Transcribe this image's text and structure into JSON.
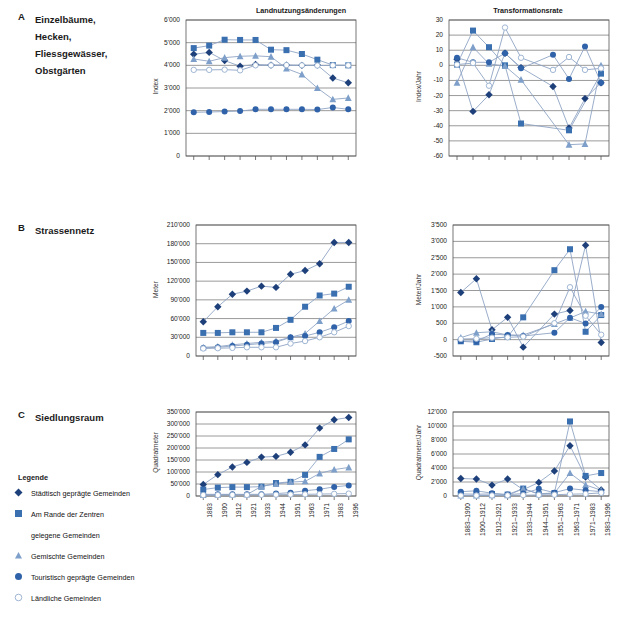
{
  "figure": {
    "panels": [
      {
        "letter": "A",
        "title_lines": [
          "Einzelbäume,",
          "Hecken,",
          "Fliessgewässer,",
          "Obstgärten"
        ]
      },
      {
        "letter": "B",
        "title_lines": [
          "Strassennetz"
        ]
      },
      {
        "letter": "C",
        "title_lines": [
          "Siedlungsraum"
        ]
      }
    ],
    "column_titles": [
      "Landnutzungsänderungen",
      "Transformationsrate"
    ]
  },
  "legend": {
    "title": "Legende",
    "items": [
      {
        "marker": "diamond",
        "color": "#1d3f7a",
        "label": "Städtisch geprägte Gemeinden"
      },
      {
        "marker": "square",
        "color": "#3a6fb0",
        "label": "Am Rande der Zentren"
      },
      {
        "marker": "none",
        "color": "#ffffff",
        "label": "gelegene Gemeinden"
      },
      {
        "marker": "triangle",
        "color": "#7d9fc9",
        "label": "Gemischte Gemeinden"
      },
      {
        "marker": "circle",
        "color": "#2f62a8",
        "label": "Touristisch geprägte Gemeinden"
      },
      {
        "marker": "opencircle",
        "color": "#ffffff",
        "label": "Ländliche Gemeinden"
      }
    ]
  },
  "series_names": [
    "Städtisch geprägte Gemeinden",
    "Am Rande der Zentren gelegene Gemeinden",
    "Gemischte Gemeinden",
    "Touristisch geprägte Gemeinden",
    "Ländliche Gemeinden"
  ],
  "colors": {
    "diamond": "#1d3f7a",
    "square": "#3a6fb0",
    "triangle": "#7d9fc9",
    "circle": "#2f62a8",
    "opencircle_stroke": "#9fb6d4",
    "line": "#8fa4c4",
    "grid": "#808080",
    "axis": "#555555"
  },
  "chart_data": [
    {
      "id": "A-left",
      "type": "line",
      "title": "Landnutzungsänderungen",
      "ylabel": "Index",
      "xlabel": "",
      "ylim": [
        0,
        6000
      ],
      "yticks": [
        0,
        1000,
        2000,
        3000,
        4000,
        5000,
        6000
      ],
      "ytick_labels": [
        "0",
        "1'000",
        "2'000",
        "3'000",
        "4'000",
        "5'000",
        "6'000"
      ],
      "categories": [
        "1883",
        "1900",
        "1912",
        "1921",
        "1933",
        "1944",
        "1951",
        "1963",
        "1971",
        "1983",
        "1996"
      ],
      "show_xticklabels": false,
      "grid": true,
      "series": [
        {
          "name": "Städtisch geprägte Gemeinden",
          "marker": "diamond",
          "values": [
            4490,
            4570,
            4210,
            3960,
            4040,
            4010,
            4010,
            4000,
            4010,
            3440,
            3230
          ]
        },
        {
          "name": "Am Rande der Zentren gelegene Gemeinden",
          "marker": "square",
          "values": [
            4760,
            4870,
            5130,
            5120,
            5120,
            4690,
            4670,
            4500,
            4250,
            4010,
            4000
          ]
        },
        {
          "name": "Gemischte Gemeinden",
          "marker": "triangle",
          "values": [
            4280,
            4180,
            4340,
            4400,
            4420,
            4380,
            3860,
            3600,
            3000,
            2500,
            2560
          ]
        },
        {
          "name": "Touristisch geprägte Gemeinden",
          "marker": "circle",
          "values": [
            1930,
            1940,
            1960,
            1980,
            2060,
            2060,
            2060,
            2060,
            2050,
            2140,
            2060
          ]
        },
        {
          "name": "Ländliche Gemeinden",
          "marker": "opencircle",
          "values": [
            3800,
            3800,
            3810,
            3780,
            4000,
            4000,
            4010,
            4000,
            3990,
            4000,
            4000
          ]
        }
      ]
    },
    {
      "id": "A-right",
      "type": "line",
      "title": "Transformationsrate",
      "ylabel": "Index/Jahr",
      "xlabel": "",
      "ylim": [
        -60,
        30
      ],
      "yticks": [
        -60,
        -50,
        -40,
        -30,
        -20,
        -10,
        0,
        10,
        20,
        30
      ],
      "ytick_labels": [
        "-60",
        "-50",
        "-40",
        "-30",
        "-20",
        "-10",
        "0",
        "10",
        "20",
        "30"
      ],
      "categories": [
        "1883–1900",
        "1900–1912",
        "1912–1921",
        "1921–1933",
        "1933–1944",
        "1944–1951",
        "1951–1963",
        "1963–1971",
        "1971–1983",
        "1983–1996"
      ],
      "show_xticklabels": false,
      "grid": true,
      "series": [
        {
          "name": "Städtisch geprägte Gemeinden",
          "marker": "diamond",
          "values": [
            4,
            -30.5,
            -19.5,
            8,
            -1.5,
            null,
            -14,
            -41.5,
            -22,
            -11.5
          ]
        },
        {
          "name": "Am Rande der Zentren gelegene Gemeinden",
          "marker": "square",
          "values": [
            0.5,
            23,
            12,
            0,
            -38.5,
            null,
            null,
            -43,
            null,
            -5.5
          ]
        },
        {
          "name": "Gemischte Gemeinden",
          "marker": "triangle",
          "values": [
            -11.5,
            12,
            1,
            -0.5,
            -9.5,
            null,
            null,
            -52.5,
            -52,
            0
          ]
        },
        {
          "name": "Touristisch geprägte Gemeinden",
          "marker": "circle",
          "values": [
            5,
            2,
            2,
            8,
            -2,
            null,
            7,
            -9,
            12.5,
            -11.5
          ]
        },
        {
          "name": "Ländliche Gemeinden",
          "marker": "opencircle",
          "values": [
            0.5,
            1.5,
            -13.5,
            25,
            5,
            null,
            -3,
            5.5,
            -3,
            -2
          ]
        }
      ]
    },
    {
      "id": "B-left",
      "type": "line",
      "title": "Landnutzungsänderungen",
      "ylabel": "Meter",
      "xlabel": "",
      "ylim": [
        0,
        210000
      ],
      "yticks": [
        0,
        30000,
        60000,
        90000,
        120000,
        150000,
        180000,
        210000
      ],
      "ytick_labels": [
        "0",
        "30'000",
        "60'000",
        "90'000",
        "120'000",
        "150'000",
        "180'000",
        "210'000"
      ],
      "categories": [
        "1883",
        "1900",
        "1912",
        "1921",
        "1933",
        "1944",
        "1951",
        "1963",
        "1971",
        "1983",
        "1996"
      ],
      "show_xticklabels": false,
      "grid": true,
      "series": [
        {
          "name": "Städtisch geprägte Gemeinden",
          "marker": "diamond",
          "values": [
            55000,
            79000,
            99000,
            104000,
            112000,
            110000,
            131000,
            137000,
            148000,
            182000,
            182000
          ]
        },
        {
          "name": "Am Rande der Zentren gelegene Gemeinden",
          "marker": "square",
          "values": [
            37000,
            37000,
            38000,
            38000,
            38000,
            45000,
            58000,
            79000,
            97000,
            100000,
            111000
          ]
        },
        {
          "name": "Gemischte Gemeinden",
          "marker": "triangle",
          "values": [
            14000,
            15000,
            18000,
            20000,
            22000,
            24000,
            30000,
            36000,
            56000,
            76000,
            90000
          ]
        },
        {
          "name": "Touristisch geprägte Gemeinden",
          "marker": "circle",
          "values": [
            13000,
            14000,
            16000,
            18000,
            20000,
            22000,
            30000,
            32000,
            38000,
            46000,
            56000
          ]
        },
        {
          "name": "Ländliche Gemeinden",
          "marker": "opencircle",
          "values": [
            12000,
            12500,
            13000,
            14000,
            14000,
            14000,
            20000,
            24000,
            30000,
            38000,
            48000
          ]
        }
      ]
    },
    {
      "id": "B-right",
      "type": "line",
      "title": "Transformationsrate",
      "ylabel": "Meter/Jahr",
      "xlabel": "",
      "ylim": [
        -500,
        3500
      ],
      "yticks": [
        -500,
        0,
        500,
        1000,
        1500,
        2000,
        2500,
        3000,
        3500
      ],
      "ytick_labels": [
        "-500",
        "0",
        "500",
        "1'000",
        "1'500",
        "2'000",
        "2'500",
        "3'000",
        "3'500"
      ],
      "categories": [
        "1883–1900",
        "1900–1912",
        "1912–1921",
        "1921–1933",
        "1933–1944",
        "1944–1951",
        "1951–1963",
        "1963–1971",
        "1971–1983",
        "1983–1996"
      ],
      "show_xticklabels": false,
      "grid": true,
      "series": [
        {
          "name": "Städtisch geprägte Gemeinden",
          "marker": "diamond",
          "values": [
            1440,
            1860,
            300,
            680,
            -230,
            null,
            780,
            890,
            2880,
            -90
          ]
        },
        {
          "name": "Am Rande der Zentren gelegene Gemeinden",
          "marker": "square",
          "values": [
            -50,
            -80,
            20,
            90,
            680,
            null,
            2120,
            2760,
            240,
            750
          ]
        },
        {
          "name": "Gemischte Gemeinden",
          "marker": "triangle",
          "values": [
            60,
            210,
            240,
            140,
            140,
            null,
            480,
            660,
            860,
            780
          ]
        },
        {
          "name": "Touristisch geprägte Gemeinden",
          "marker": "circle",
          "values": [
            -40,
            -40,
            170,
            140,
            110,
            null,
            210,
            670,
            490,
            1000
          ]
        },
        {
          "name": "Ländliche Gemeinden",
          "marker": "opencircle",
          "values": [
            20,
            30,
            60,
            70,
            90,
            null,
            500,
            1600,
            730,
            150
          ]
        }
      ]
    },
    {
      "id": "C-left",
      "type": "line",
      "title": "Landnutzungsänderungen",
      "ylabel": "Quadratmeter",
      "xlabel": "",
      "ylim": [
        0,
        350000
      ],
      "yticks": [
        0,
        50000,
        100000,
        150000,
        200000,
        250000,
        300000,
        350000
      ],
      "ytick_labels": [
        "0",
        "50'000",
        "100'000",
        "150'000",
        "200'000",
        "250'000",
        "300'000",
        "350'000"
      ],
      "categories": [
        "1883",
        "1900",
        "1912",
        "1921",
        "1933",
        "1944",
        "1951",
        "1963",
        "1971",
        "1983",
        "1996"
      ],
      "show_xticklabels": true,
      "grid": true,
      "series": [
        {
          "name": "Städtisch geprägte Gemeinden",
          "marker": "diamond",
          "values": [
            48000,
            89000,
            121000,
            140000,
            162000,
            165000,
            182000,
            213000,
            283000,
            318000,
            327000
          ]
        },
        {
          "name": "Am Rande der Zentren gelegene Gemeinden",
          "marker": "square",
          "values": [
            27000,
            35000,
            37000,
            37000,
            39000,
            54000,
            59000,
            88000,
            163000,
            196000,
            236000
          ]
        },
        {
          "name": "Gemischte Gemeinden",
          "marker": "triangle",
          "values": [
            4000,
            5000,
            6000,
            6000,
            40000,
            50000,
            58000,
            61000,
            94000,
            110000,
            119000
          ]
        },
        {
          "name": "Touristisch geprägte Gemeinden",
          "marker": "circle",
          "values": [
            7000,
            7000,
            7000,
            7000,
            7000,
            10000,
            14000,
            22000,
            28000,
            38000,
            44000
          ]
        },
        {
          "name": "Ländliche Gemeinden",
          "marker": "opencircle",
          "values": [
            4000,
            4000,
            4500,
            4500,
            5000,
            5500,
            6000,
            7000,
            8000,
            9000,
            10000
          ]
        }
      ]
    },
    {
      "id": "C-right",
      "type": "line",
      "title": "Transformationsrate",
      "ylabel": "Quadratmeter/Jahr",
      "xlabel": "",
      "ylim": [
        0,
        12000
      ],
      "yticks": [
        0,
        2000,
        4000,
        6000,
        8000,
        10000,
        12000
      ],
      "ytick_labels": [
        "0",
        "2'000",
        "4'000",
        "6'000",
        "8'000",
        "10'000",
        "12'000"
      ],
      "categories": [
        "1883–1900",
        "1900–1912",
        "1912–1921",
        "1921–1933",
        "1933–1944",
        "1944–1951",
        "1951–1963",
        "1963–1971",
        "1971–1983",
        "1983–1996"
      ],
      "show_xticklabels": true,
      "grid": true,
      "series": [
        {
          "name": "Städtisch geprägte Gemeinden",
          "marker": "diamond",
          "values": [
            2500,
            2420,
            1560,
            2420,
            900,
            1940,
            3580,
            7170,
            2700,
            850
          ]
        },
        {
          "name": "Am Rande der Zentren gelegene Gemeinden",
          "marker": "square",
          "values": [
            300,
            260,
            290,
            200,
            1060,
            260,
            420,
            10650,
            2870,
            3280
          ]
        },
        {
          "name": "Gemischte Gemeinden",
          "marker": "triangle",
          "values": [
            80,
            80,
            90,
            100,
            1030,
            330,
            420,
            3270,
            1580,
            820
          ]
        },
        {
          "name": "Touristisch geprägte Gemeinden",
          "marker": "circle",
          "values": [
            620,
            740,
            400,
            200,
            350,
            1020,
            480,
            1060,
            820,
            620
          ]
        },
        {
          "name": "Ländliche Gemeinden",
          "marker": "opencircle",
          "values": [
            60,
            70,
            80,
            90,
            120,
            150,
            180,
            260,
            300,
            450
          ]
        }
      ]
    }
  ]
}
